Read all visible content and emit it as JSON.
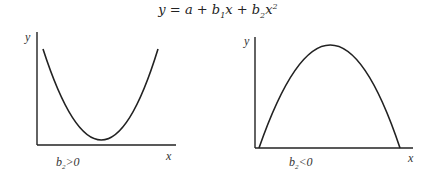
{
  "equation": {
    "lhs": "y",
    "a": "a",
    "b1": "b",
    "b1_sub": "1",
    "x1": "x",
    "b2": "b",
    "b2_sub": "2",
    "x2": "x",
    "x2_sup": "2"
  },
  "panels": [
    {
      "id": "convex",
      "y_label": "y",
      "x_label": "x",
      "condition_var": "b",
      "condition_sub": "2",
      "condition_rel": ">0",
      "shape": "U-shaped (minimum)"
    },
    {
      "id": "concave",
      "y_label": "y",
      "x_label": "x",
      "condition_var": "b",
      "condition_sub": "2",
      "condition_rel": "<0",
      "shape": "inverted U (maximum)"
    }
  ],
  "colors": {
    "line": "#222222",
    "axis": "#222222",
    "text": "#333333"
  }
}
